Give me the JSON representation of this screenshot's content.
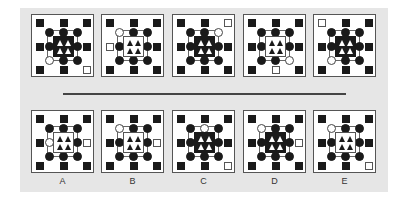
{
  "colors": {
    "panel": "#e6e6e6",
    "ink": "#1a1a1a",
    "divider": "#444444"
  },
  "question_row": [
    {
      "outer_white": "br",
      "circle_white": "bl",
      "center": "dark"
    },
    {
      "outer_white": "l",
      "circle_white": "tl",
      "center": "light"
    },
    {
      "outer_white": "tr",
      "circle_white": "tr",
      "center": "dark"
    },
    {
      "outer_white": "b",
      "circle_white": "br",
      "center": "light"
    },
    {
      "outer_white": "tl",
      "circle_white": "bl",
      "center": "dark"
    }
  ],
  "options": [
    {
      "label": "A",
      "outer_white": "r",
      "circle_white": "l",
      "center": "light"
    },
    {
      "label": "B",
      "outer_white": "r",
      "circle_white": "tl",
      "center": "light"
    },
    {
      "label": "C",
      "outer_white": "br",
      "circle_white": "t",
      "center": "dark"
    },
    {
      "label": "D",
      "outer_white": "r",
      "circle_white": "tl",
      "center": "dark"
    },
    {
      "label": "E",
      "outer_white": "br",
      "circle_white": "tl",
      "center": "light"
    }
  ]
}
